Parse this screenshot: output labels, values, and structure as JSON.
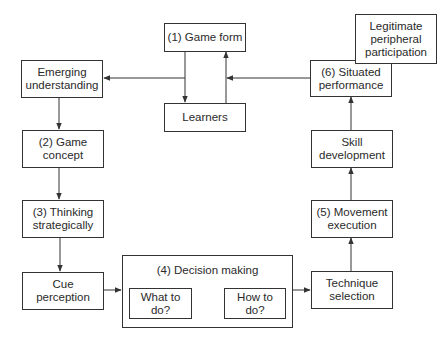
{
  "diagram": {
    "nodes": {
      "game_form": "(1) Game form",
      "learners": "Learners",
      "emerging_understanding": "Emerging\nunderstanding",
      "game_concept": "(2) Game\nconcept",
      "thinking_strategically": "(3) Thinking\nstrategically",
      "cue_perception": "Cue\nperception",
      "decision_making": "(4) Decision making",
      "what_to_do": "What to\ndo?",
      "how_to_do": "How to\ndo?",
      "technique_selection": "Technique\nselection",
      "movement_execution": "(5) Movement\nexecution",
      "skill_development": "Skill\ndevelopment",
      "situated_performance": "(6) Situated\nperformance",
      "legitimate_peripheral_participation": "Legitimate\nperipheral\nparticipation"
    },
    "edges": [
      {
        "from": "game_form",
        "to": "learners"
      },
      {
        "from": "learners",
        "to": "game_form"
      },
      {
        "from": "game_form",
        "to": "emerging_understanding"
      },
      {
        "from": "emerging_understanding",
        "to": "game_concept"
      },
      {
        "from": "game_concept",
        "to": "thinking_strategically"
      },
      {
        "from": "thinking_strategically",
        "to": "cue_perception"
      },
      {
        "from": "cue_perception",
        "to": "decision_making"
      },
      {
        "from": "what_to_do",
        "to": "how_to_do",
        "bidirectional": true
      },
      {
        "from": "decision_making",
        "to": "technique_selection"
      },
      {
        "from": "technique_selection",
        "to": "movement_execution"
      },
      {
        "from": "movement_execution",
        "to": "skill_development"
      },
      {
        "from": "skill_development",
        "to": "situated_performance"
      },
      {
        "from": "situated_performance",
        "to": "game_form"
      }
    ],
    "line_color": "#333333"
  }
}
